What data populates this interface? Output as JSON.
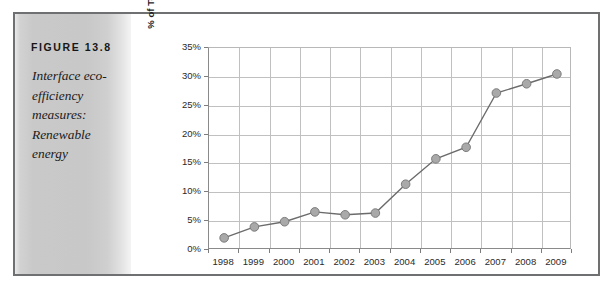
{
  "figure": {
    "label": "FIGURE 13.8",
    "caption": "Interface eco-efficiency measures: Renewable energy",
    "panel_color": "#c8c8c8",
    "frame_color": "#6f7072"
  },
  "chart_data": {
    "type": "line",
    "title": "",
    "subtitle": "",
    "xlabel": "",
    "ylabel": "% of Total Energy Use",
    "categories": [
      "1998",
      "1999",
      "2000",
      "2001",
      "2002",
      "2003",
      "2004",
      "2005",
      "2006",
      "2007",
      "2008",
      "2009"
    ],
    "values": [
      2.1,
      4.0,
      4.9,
      6.6,
      6.1,
      6.4,
      11.4,
      15.8,
      17.8,
      27.2,
      28.8,
      30.5
    ],
    "series": [
      {
        "name": "Renewable energy",
        "values": [
          2.1,
          4.0,
          4.9,
          6.6,
          6.1,
          6.4,
          11.4,
          15.8,
          17.8,
          27.2,
          28.8,
          30.5
        ]
      }
    ],
    "ylim": [
      0,
      35
    ],
    "ytick_values": [
      0,
      5,
      10,
      15,
      20,
      25,
      30,
      35
    ],
    "ytick_labels": [
      "0%",
      "5%",
      "10%",
      "15%",
      "20%",
      "25%",
      "30%",
      "35%"
    ],
    "xtick_labels": [
      "1998",
      "1999",
      "2000",
      "2001",
      "2002",
      "2003",
      "2004",
      "2005",
      "2006",
      "2007",
      "2008",
      "2009"
    ],
    "grid": true,
    "grid_horizontal": true,
    "grid_vertical": true,
    "legend": false,
    "legend_position": "none",
    "marker": "circle",
    "marker_color": "#a9a9a9",
    "line_color": "#6b6b6b",
    "annotations": []
  }
}
